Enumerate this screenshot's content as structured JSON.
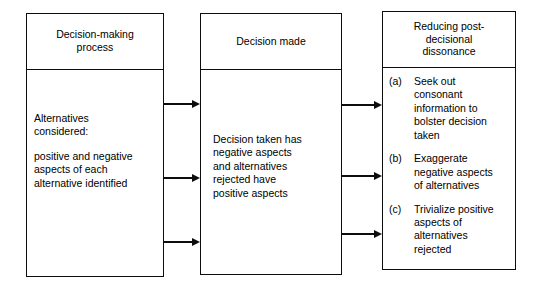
{
  "diagram": {
    "stroke_color": "#0d0d0d",
    "background_color": "#ffffff",
    "boxes": [
      {
        "id": "decision-making-process",
        "header": "Decision-making\nprocess",
        "header_lines": [
          "Decision-making",
          "process"
        ],
        "body_paragraphs": [
          "Alternatives\nconsidered:",
          "positive and negative\naspects of each\nalternative identified"
        ]
      },
      {
        "id": "decision-made",
        "header": "Decision made",
        "header_lines": [
          "Decision made"
        ],
        "body_paragraphs": [
          "Decision taken has\nnegative aspects\nand alternatives\nrejected have\npositive aspects"
        ]
      },
      {
        "id": "reducing-post-decisional-dissonance",
        "header": "Reducing post-\ndecisional\ndissonance",
        "header_lines": [
          "Reducing post-",
          "decisional",
          "dissonance"
        ],
        "list_items": [
          {
            "marker": "(a)",
            "text": "Seek out\nconsonant\ninformation to\nbolster decision\ntaken"
          },
          {
            "marker": "(b)",
            "text": "Exaggerate\nnegative aspects\nof alternatives"
          },
          {
            "marker": "(c)",
            "text": "Trivialize positive\naspects of\nalternatives\nrejected"
          }
        ]
      }
    ],
    "connectors": [
      {
        "id": "arrow-1-a",
        "from": "decision-making-process",
        "to": "decision-made",
        "direction": "right"
      },
      {
        "id": "arrow-1-b",
        "from": "decision-making-process",
        "to": "decision-made",
        "direction": "right"
      },
      {
        "id": "arrow-1-c",
        "from": "decision-making-process",
        "to": "decision-made",
        "direction": "right"
      },
      {
        "id": "arrow-2-a",
        "from": "decision-made",
        "to": "reducing-post-decisional-dissonance",
        "direction": "right"
      },
      {
        "id": "arrow-2-b",
        "from": "decision-made",
        "to": "reducing-post-decisional-dissonance",
        "direction": "right"
      },
      {
        "id": "arrow-2-c",
        "from": "decision-made",
        "to": "reducing-post-decisional-dissonance",
        "direction": "right"
      }
    ]
  }
}
